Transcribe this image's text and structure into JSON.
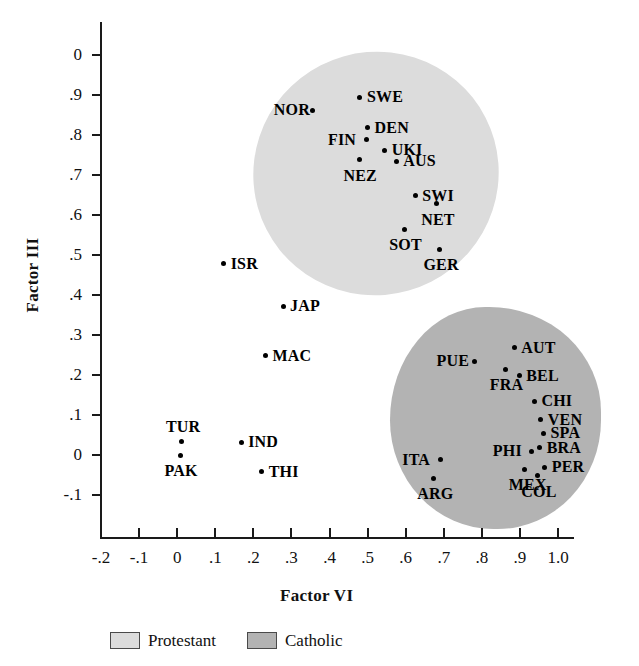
{
  "chart_data": {
    "type": "scatter",
    "title": "",
    "xlabel": "Factor VI",
    "ylabel": "Factor III",
    "xlim": [
      -0.2,
      1.0
    ],
    "ylim": [
      -0.1,
      1.0
    ],
    "grid": false,
    "xticks": [
      "-.2",
      "-.1",
      "0",
      ".1",
      ".2",
      ".3",
      ".4",
      ".5",
      ".6",
      ".7",
      ".8",
      ".9",
      "1.0"
    ],
    "xtick_values": [
      -0.2,
      -0.1,
      0,
      0.1,
      0.2,
      0.3,
      0.4,
      0.5,
      0.6,
      0.7,
      0.8,
      0.9,
      1.0
    ],
    "yticks": [
      "0",
      ".9",
      ".8",
      ".7",
      ".6",
      ".5",
      ".4",
      ".3",
      ".2",
      ".1",
      "0",
      "-.1"
    ],
    "ytick_values": [
      1.0,
      0.9,
      0.8,
      0.7,
      0.6,
      0.5,
      0.4,
      0.3,
      0.2,
      0.1,
      0.0,
      -0.1
    ],
    "legend_position": "bottom",
    "points": [
      {
        "label": "SWE",
        "x": 0.48,
        "y": 0.895,
        "group": "Protestant",
        "label_side": "right"
      },
      {
        "label": "NOR",
        "x": 0.355,
        "y": 0.862,
        "group": "Protestant",
        "label_side": "left"
      },
      {
        "label": "DEN",
        "x": 0.5,
        "y": 0.818,
        "group": "Protestant",
        "label_side": "right"
      },
      {
        "label": "FIN",
        "x": 0.497,
        "y": 0.788,
        "group": "Protestant",
        "label_side": "left"
      },
      {
        "label": "UKI",
        "x": 0.545,
        "y": 0.762,
        "group": "Protestant",
        "label_side": "right"
      },
      {
        "label": "NEZ",
        "x": 0.478,
        "y": 0.738,
        "group": "Protestant",
        "label_side": "below"
      },
      {
        "label": "AUS",
        "x": 0.575,
        "y": 0.735,
        "group": "Protestant",
        "label_side": "right"
      },
      {
        "label": "SWI",
        "x": 0.625,
        "y": 0.648,
        "group": "Protestant",
        "label_side": "right"
      },
      {
        "label": "NET",
        "x": 0.682,
        "y": 0.628,
        "group": "Protestant",
        "label_side": "below"
      },
      {
        "label": "SOT",
        "x": 0.598,
        "y": 0.565,
        "group": "Protestant",
        "label_side": "below"
      },
      {
        "label": "GER",
        "x": 0.688,
        "y": 0.515,
        "group": "Protestant",
        "label_side": "below"
      },
      {
        "label": "ISR",
        "x": 0.122,
        "y": 0.478,
        "group": "Other",
        "label_side": "right"
      },
      {
        "label": "JAP",
        "x": 0.278,
        "y": 0.372,
        "group": "Other",
        "label_side": "right"
      },
      {
        "label": "MAC",
        "x": 0.232,
        "y": 0.248,
        "group": "Other",
        "label_side": "right"
      },
      {
        "label": "TUR",
        "x": 0.012,
        "y": 0.035,
        "group": "Other",
        "label_side": "above"
      },
      {
        "label": "IND",
        "x": 0.168,
        "y": 0.032,
        "group": "Other",
        "label_side": "right"
      },
      {
        "label": "PAK",
        "x": 0.008,
        "y": 0.0,
        "group": "Other",
        "label_side": "below"
      },
      {
        "label": "THI",
        "x": 0.222,
        "y": -0.042,
        "group": "Other",
        "label_side": "right"
      },
      {
        "label": "AUT",
        "x": 0.885,
        "y": 0.268,
        "group": "Catholic",
        "label_side": "right"
      },
      {
        "label": "PUE",
        "x": 0.782,
        "y": 0.235,
        "group": "Catholic",
        "label_side": "left"
      },
      {
        "label": "FRA",
        "x": 0.862,
        "y": 0.215,
        "group": "Catholic",
        "label_side": "below"
      },
      {
        "label": "BEL",
        "x": 0.898,
        "y": 0.198,
        "group": "Catholic",
        "label_side": "right"
      },
      {
        "label": "CHI",
        "x": 0.938,
        "y": 0.135,
        "group": "Catholic",
        "label_side": "right"
      },
      {
        "label": "VEN",
        "x": 0.955,
        "y": 0.088,
        "group": "Catholic",
        "label_side": "right"
      },
      {
        "label": "SPA",
        "x": 0.962,
        "y": 0.055,
        "group": "Catholic",
        "label_side": "right"
      },
      {
        "label": "BRA",
        "x": 0.952,
        "y": 0.018,
        "group": "Catholic",
        "label_side": "right"
      },
      {
        "label": "PHI",
        "x": 0.93,
        "y": 0.01,
        "group": "Catholic",
        "label_side": "left"
      },
      {
        "label": "ITA",
        "x": 0.692,
        "y": -0.012,
        "group": "Catholic",
        "label_side": "left"
      },
      {
        "label": "PER",
        "x": 0.965,
        "y": -0.03,
        "group": "Catholic",
        "label_side": "right"
      },
      {
        "label": "MEX",
        "x": 0.912,
        "y": -0.035,
        "group": "Catholic",
        "label_side": "below"
      },
      {
        "label": "COL",
        "x": 0.945,
        "y": -0.052,
        "group": "Catholic",
        "label_side": "below"
      },
      {
        "label": "ARG",
        "x": 0.672,
        "y": -0.058,
        "group": "Catholic",
        "label_side": "below"
      }
    ],
    "clusters": [
      {
        "name": "Protestant",
        "color": "#dcdcdc"
      },
      {
        "name": "Catholic",
        "color": "#b3b3b3"
      }
    ]
  },
  "legend": {
    "items": [
      {
        "label": "Protestant",
        "color": "#dcdcdc"
      },
      {
        "label": "Catholic",
        "color": "#b3b3b3"
      }
    ]
  }
}
